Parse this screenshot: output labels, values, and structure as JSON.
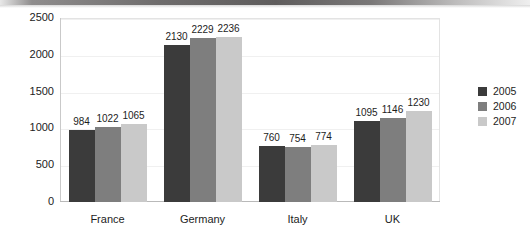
{
  "chart_data": {
    "type": "bar",
    "title": "",
    "subtitle": "",
    "xlabel": "",
    "ylabel": "",
    "categories": [
      "France",
      "Germany",
      "Italy",
      "UK"
    ],
    "series": [
      {
        "name": "2005",
        "color": "#3b3b3b",
        "values": [
          984,
          2130,
          760,
          1095
        ]
      },
      {
        "name": "2006",
        "color": "#7e7e7e",
        "values": [
          1022,
          2229,
          754,
          1146
        ]
      },
      {
        "name": "2007",
        "color": "#c9c9c9",
        "values": [
          1065,
          2236,
          774,
          1230
        ]
      }
    ],
    "ylim": [
      0,
      2500
    ],
    "yticks": [
      0,
      500,
      1000,
      1500,
      2000,
      2500
    ],
    "ytick_labels": [
      "0",
      "500",
      "1000",
      "1500",
      "2000",
      "2500"
    ],
    "grid": true,
    "grid_axis": "y",
    "legend_position": "right",
    "data_labels": true,
    "data_label_values": [
      [
        "984",
        "1022",
        "1065"
      ],
      [
        "2130",
        "2229",
        "2236"
      ],
      [
        "760",
        "754",
        "774"
      ],
      [
        "1095",
        "1146",
        "1230"
      ]
    ],
    "background_color": "#ffffff",
    "plot_border_color": "#d6d6d6"
  },
  "legend": {
    "items": [
      {
        "label": "2005",
        "color": "#3b3b3b"
      },
      {
        "label": "2006",
        "color": "#7e7e7e"
      },
      {
        "label": "2007",
        "color": "#c9c9c9"
      }
    ]
  }
}
